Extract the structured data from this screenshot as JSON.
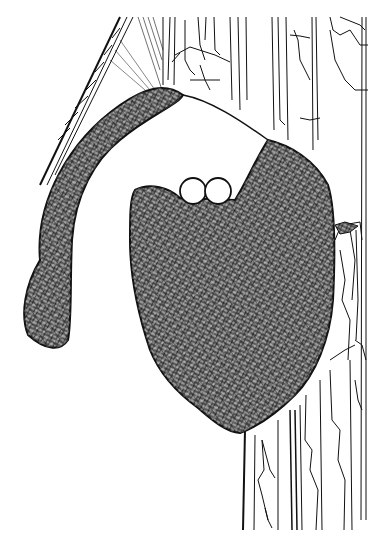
{
  "illustration": {
    "subject": "Hanging woven bird nest attached to tree trunk with two eggs visible at the entrance",
    "style": "black-and-white pen-and-ink line drawing",
    "background_color": "#ffffff",
    "ink_color": "#111111",
    "fill_texture_color": "#4a4a4a",
    "elements": {
      "tree_trunk": "tree-trunk with vertical bark lines on the right side",
      "branch": "diagonal branch on upper left",
      "nest_tube": "curved entrance tube hanging down left",
      "nest_body": "main rounded nest chamber",
      "eggs": [
        "egg-left",
        "egg-right"
      ]
    }
  }
}
